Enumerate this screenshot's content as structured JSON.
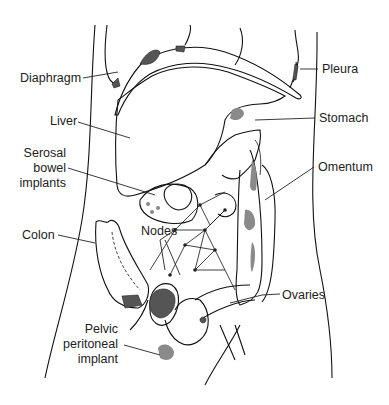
{
  "figure": {
    "colors": {
      "line": "#111111",
      "implant_gray": "#8a8a8a",
      "implant_dark": "#555555",
      "background": "#ffffff"
    },
    "labels": {
      "diaphragm": "Diaphragm",
      "pleura": "Pleura",
      "liver": "Liver",
      "stomach": "Stomach",
      "serosal_1": "Serosal",
      "serosal_2": "bowel",
      "serosal_3": "implants",
      "omentum": "Omentum",
      "colon": "Colon",
      "nodes": "Nodes",
      "ovaries": "Ovaries",
      "pelvic_1": "Pelvic",
      "pelvic_2": "peritoneal",
      "pelvic_3": "implant"
    }
  }
}
